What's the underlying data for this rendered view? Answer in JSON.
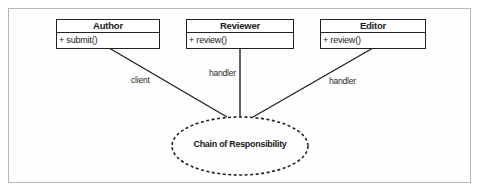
{
  "diagram": {
    "classes": [
      {
        "name": "Author",
        "method": "+ submit()"
      },
      {
        "name": "Reviewer",
        "method": "+ review()"
      },
      {
        "name": "Editor",
        "method": "+ review()"
      }
    ],
    "roles": [
      {
        "from": "Author",
        "label": "client"
      },
      {
        "from": "Reviewer",
        "label": "handler"
      },
      {
        "from": "Editor",
        "label": "handler"
      }
    ],
    "pattern": {
      "label": "Chain of Responsibility",
      "shape": "dashed-ellipse"
    },
    "colors": {
      "line": "#222222",
      "frame": "#b8b8b8",
      "background": "#ffffff"
    }
  }
}
